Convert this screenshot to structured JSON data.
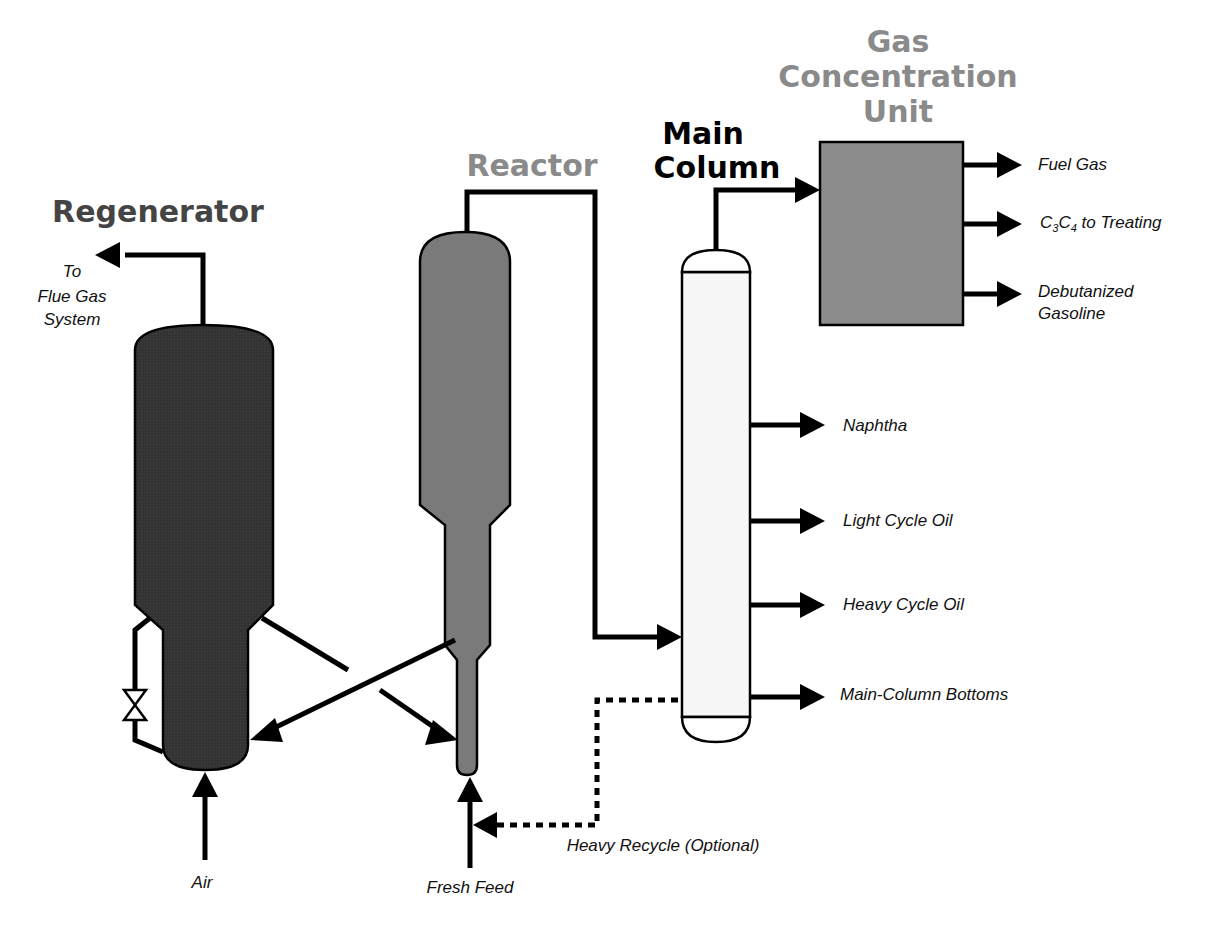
{
  "diagram": {
    "type": "process-flow",
    "titles": {
      "regenerator": "Regenerator",
      "reactor": "Reactor",
      "main_column_line1": "Main",
      "main_column_line2": "Column",
      "gcu_line1": "Gas",
      "gcu_line2": "Concentration",
      "gcu_line3": "Unit"
    },
    "streams": {
      "flue_line1": "To",
      "flue_line2": "Flue Gas",
      "flue_line3": "System",
      "air": "Air",
      "fresh_feed": "Fresh Feed",
      "heavy_recycle": "Heavy Recycle (Optional)",
      "fuel_gas": "Fuel Gas",
      "c3c4_c": "C",
      "c3c4_sub1": "3",
      "c3c4_c2": "C",
      "c3c4_sub2": "4",
      "c3c4_rest": " to Treating",
      "debut_line1": "Debutanized",
      "debut_line2": "Gasoline",
      "naphtha": "Naphtha",
      "lco": "Light Cycle Oil",
      "hco": "Heavy Cycle Oil",
      "bottoms": "Main-Column Bottoms"
    },
    "colors": {
      "regenerator": "#333333",
      "reactor": "#7a7a7a",
      "gcu": "#8c8c8c",
      "column": "#f7f7f7",
      "title_dark": "#444444",
      "title_gray": "#8a8a8a",
      "title_black": "#000000"
    }
  }
}
